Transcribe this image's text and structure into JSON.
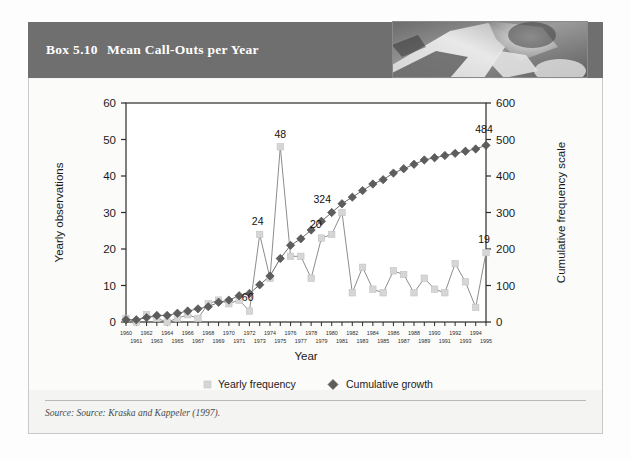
{
  "box": {
    "number": "Box 5.10",
    "title": "Mean Call-Outs per Year"
  },
  "source": "Source: Source: Kraska and Kappeler (1997).",
  "colors": {
    "header_band": "#6f6f6f",
    "yearly_marker": "#d6d6d6",
    "yearly_line": "#8c8c8c",
    "cumulative_marker": "#5d5d5d",
    "cumulative_line": "#6b6b6b",
    "axis": "#2b2b2b",
    "page_bg": "#f4f4f2"
  },
  "chart_data": {
    "type": "line",
    "title": "Mean Call-Outs per Year",
    "xlabel": "Year",
    "ylabel": "Yearly observations",
    "y2label": "Cumulative frequency scale",
    "ylim": [
      0,
      60
    ],
    "y2lim": [
      0,
      600
    ],
    "yticks": [
      0,
      10,
      20,
      30,
      40,
      50,
      60
    ],
    "y2ticks": [
      0,
      100,
      200,
      300,
      400,
      500,
      600
    ],
    "grid": false,
    "legend_position": "bottom",
    "categories": [
      "1960",
      "1961",
      "1962",
      "1963",
      "1964",
      "1965",
      "1966",
      "1967",
      "1968",
      "1969",
      "1970",
      "1971",
      "1972",
      "1973",
      "1974",
      "1975",
      "1976",
      "1977",
      "1978",
      "1979",
      "1980",
      "1981",
      "1982",
      "1983",
      "1984",
      "1985",
      "1986",
      "1987",
      "1988",
      "1989",
      "1990",
      "1991",
      "1992",
      "1993",
      "1994",
      "1995"
    ],
    "series": [
      {
        "name": "Yearly frequency",
        "axis": "left",
        "marker": "square",
        "values": [
          1,
          0,
          2,
          1,
          0,
          1,
          2,
          1,
          5,
          6,
          5,
          6,
          3,
          24,
          12,
          48,
          18,
          18,
          12,
          23,
          24,
          30,
          8,
          15,
          9,
          8,
          14,
          13,
          8,
          12,
          9,
          8,
          16,
          11,
          4,
          19
        ]
      },
      {
        "name": "Cumulative growth",
        "axis": "right",
        "marker": "diamond",
        "values": [
          6,
          6,
          12,
          18,
          18,
          24,
          30,
          36,
          42,
          54,
          60,
          72,
          78,
          102,
          126,
          174,
          210,
          228,
          252,
          276,
          300,
          324,
          342,
          360,
          378,
          390,
          408,
          420,
          432,
          444,
          450,
          456,
          462,
          468,
          474,
          484
        ]
      }
    ],
    "annotations": [
      {
        "label": "24",
        "series": "Yearly frequency",
        "category": "1973",
        "value": 24
      },
      {
        "label": "48",
        "series": "Yearly frequency",
        "category": "1975",
        "value": 48
      },
      {
        "label": "20",
        "series": "Yearly frequency",
        "category": "1980",
        "value": 24
      },
      {
        "label": "19",
        "series": "Yearly frequency",
        "category": "1995",
        "value": 19
      },
      {
        "label": "60",
        "series": "Cumulative growth",
        "category": "1970",
        "value": 60
      },
      {
        "label": "324",
        "series": "Cumulative growth",
        "category": "1981",
        "value": 324
      },
      {
        "label": "484",
        "series": "Cumulative growth",
        "category": "1995",
        "value": 484
      }
    ],
    "legend": [
      {
        "label": "Yearly frequency",
        "marker": "square",
        "color": "#d6d6d6"
      },
      {
        "label": "Cumulative growth",
        "marker": "diamond",
        "color": "#5d5d5d"
      }
    ]
  }
}
